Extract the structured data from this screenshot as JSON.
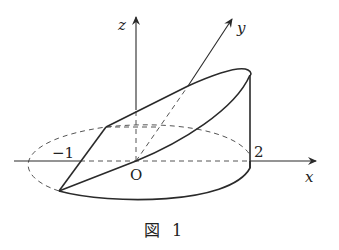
{
  "figure": {
    "caption": "図 1",
    "caption_symbol": "図",
    "caption_number": "1"
  },
  "axes": {
    "x_label": "x",
    "y_label": "y",
    "z_label": "z",
    "origin_label": "O"
  },
  "ticks": {
    "neg_one": "−1",
    "two": "2"
  },
  "colors": {
    "stroke": "#2a2a2a",
    "dashed": "#555555",
    "background": "#ffffff"
  }
}
